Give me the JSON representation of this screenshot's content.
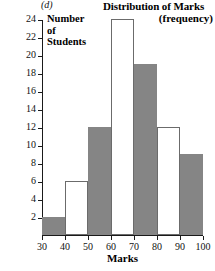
{
  "panel_label": "(d)",
  "title": "Distribution of Marks",
  "subtitle": "(frequency)",
  "y_axis_label_lines": [
    "Number",
    "of",
    "Students"
  ],
  "x_axis_label": "Marks",
  "colors": {
    "bar_fill": "#858585",
    "bar_stroke": "#6b6b6b",
    "axis": "#1a1a1a",
    "background": "#ffffff"
  },
  "chart_data": {
    "type": "bar",
    "title": "Distribution of Marks",
    "subtitle": "(frequency)",
    "xlabel": "Marks",
    "ylabel": "Number of Students",
    "categories": [
      "30-40",
      "40-50",
      "50-60",
      "60-70",
      "70-80",
      "80-90",
      "90-100"
    ],
    "bin_edges": [
      30,
      40,
      50,
      60,
      70,
      80,
      90,
      100
    ],
    "values": [
      2,
      6,
      12,
      24,
      19,
      12,
      9
    ],
    "bar_styles": [
      "filled",
      "hollow",
      "filled",
      "hollow",
      "filled",
      "hollow",
      "filled"
    ],
    "xlim": [
      30,
      100
    ],
    "ylim": [
      0,
      24
    ],
    "x_ticks": [
      30,
      40,
      50,
      60,
      70,
      80,
      90,
      100
    ],
    "y_ticks": [
      2,
      4,
      6,
      8,
      10,
      12,
      14,
      16,
      18,
      20,
      22,
      24
    ],
    "grid": false,
    "legend": null
  }
}
